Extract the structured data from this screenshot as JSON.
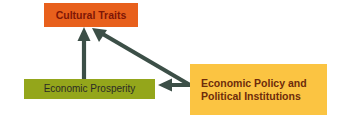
{
  "diagram": {
    "type": "causal-flow-diagram",
    "canvas": {
      "width": 340,
      "height": 116,
      "background": "#FFFFFF"
    },
    "nodes": [
      {
        "id": "cultural-traits",
        "label": "Cultural Traits",
        "fill": "#E8601C",
        "text_color": "#7E1606",
        "x": 44,
        "y": 3,
        "width": 94,
        "height": 24
      },
      {
        "id": "economic-prosperity",
        "label": "Economic Prosperity",
        "fill": "#94A61B",
        "text_color": "#2B2B26",
        "x": 24,
        "y": 79,
        "width": 131,
        "height": 20
      },
      {
        "id": "economic-policy",
        "label": "Economic Policy and\nPolitical Institutions",
        "fill": "#FBC442",
        "text_color": "#6E2C0B",
        "x": 190,
        "y": 64,
        "width": 137,
        "height": 51
      }
    ],
    "arrows": [
      {
        "id": "prosperity-to-traits",
        "from": "economic-prosperity",
        "to": "cultural-traits",
        "color": "#3C4F47",
        "direction": "up"
      },
      {
        "id": "policy-to-traits",
        "from": "economic-policy",
        "to": "cultural-traits",
        "color": "#3C4F47",
        "direction": "diagonal-up-left"
      },
      {
        "id": "policy-to-prosperity",
        "from": "economic-policy",
        "to": "economic-prosperity",
        "color": "#3C4F47",
        "direction": "left"
      }
    ]
  }
}
